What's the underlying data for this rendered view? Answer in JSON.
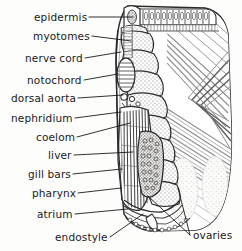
{
  "figure": {
    "style": "pen-and-ink-stipple-line-drawing",
    "background_color": "#fdfdfc",
    "ink_color": "#2b2b2b"
  },
  "labels": {
    "left": [
      {
        "text": "epidermis",
        "x": 34,
        "y": 11,
        "leader_to_x": 133,
        "leader_to_y": 17
      },
      {
        "text": "myotomes",
        "x": 33,
        "y": 30,
        "leader_to_x": 131,
        "leader_to_y": 41
      },
      {
        "text": "nerve cord",
        "x": 25,
        "y": 52,
        "leader_to_x": 121,
        "leader_to_y": 52
      },
      {
        "text": "notochord",
        "x": 27,
        "y": 74,
        "leader_to_x": 118,
        "leader_to_y": 74
      },
      {
        "text": "dorsal aorta",
        "x": 11,
        "y": 92,
        "leader_to_x": 123,
        "leader_to_y": 95
      },
      {
        "text": "nephridium",
        "x": 11,
        "y": 112,
        "leader_to_x": 121,
        "leader_to_y": 112
      },
      {
        "text": "coelom",
        "x": 36,
        "y": 131,
        "leader_to_x": 130,
        "leader_to_y": 123
      },
      {
        "text": "liver",
        "x": 48,
        "y": 149,
        "leader_to_x": 133,
        "leader_to_y": 152
      },
      {
        "text": "gill bars",
        "x": 28,
        "y": 168,
        "leader_to_x": 122,
        "leader_to_y": 169
      },
      {
        "text": "pharynx",
        "x": 32,
        "y": 187,
        "leader_to_x": 121,
        "leader_to_y": 188
      },
      {
        "text": "atrium",
        "x": 37,
        "y": 208,
        "leader_to_x": 128,
        "leader_to_y": 209
      },
      {
        "text": "endostyle",
        "x": 55,
        "y": 231,
        "leader_to_x": 143,
        "leader_to_y": 214
      }
    ],
    "right": [
      {
        "text": "ovaries",
        "x": 193,
        "y": 229,
        "leader_to_x": 148,
        "leader_to_y": 196,
        "leader2_to_x": 178,
        "leader2_to_y": 188
      }
    ]
  },
  "structures": {
    "dorsal_fin_boxes_count": 13,
    "myotome_blocks_count": 9,
    "gill_bar_count": 14,
    "notochord_stripes": 9,
    "chevron_count": 3
  }
}
